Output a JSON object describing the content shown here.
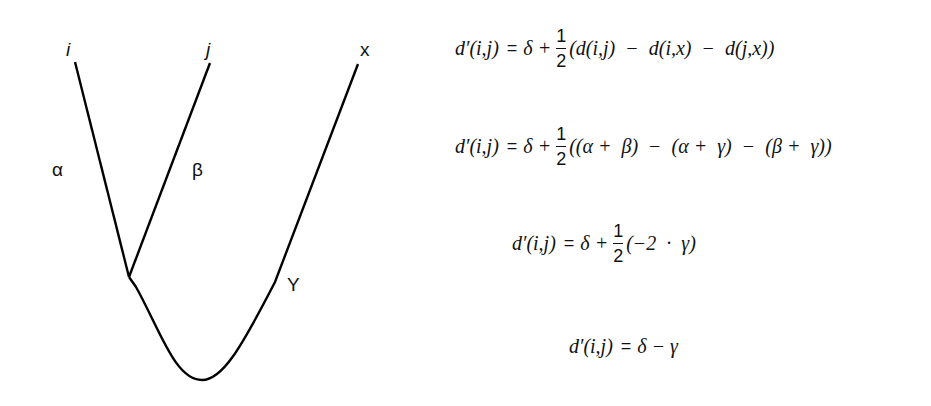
{
  "tree": {
    "leaves": [
      {
        "id": "i",
        "label": "i",
        "x": 75,
        "y": 62
      },
      {
        "id": "j",
        "label": "j",
        "x": 210,
        "y": 63
      },
      {
        "id": "x",
        "label": "x",
        "x": 358,
        "y": 64
      }
    ],
    "internal_node": {
      "x": 129,
      "y": 277
    },
    "root_bottom": {
      "x": 202,
      "y": 380
    },
    "branch_labels": {
      "alpha": "α",
      "beta": "β",
      "gamma": "Y"
    },
    "stroke_color": "#000000"
  },
  "equations": [
    {
      "lhs": "d′(i,j)",
      "op": "=",
      "pre": "δ +",
      "frac": {
        "num": "1",
        "den": "2"
      },
      "rhs": "(d(i,j)  −  d(i,x)  −  d(j,x))"
    },
    {
      "lhs": "d′(i,j)",
      "op": "=",
      "pre": "δ +",
      "frac": {
        "num": "1",
        "den": "2"
      },
      "rhs": "((α +  β)  −  (α +  γ)  −  (β +  γ))"
    },
    {
      "lhs": "d′(i,j)",
      "op": "=",
      "pre": "δ +",
      "frac": {
        "num": "1",
        "den": "2"
      },
      "rhs": "(−2  ·  γ)"
    },
    {
      "lhs": "d′(i,j)",
      "op": "=",
      "pre": "δ − γ",
      "rhs": ""
    }
  ]
}
